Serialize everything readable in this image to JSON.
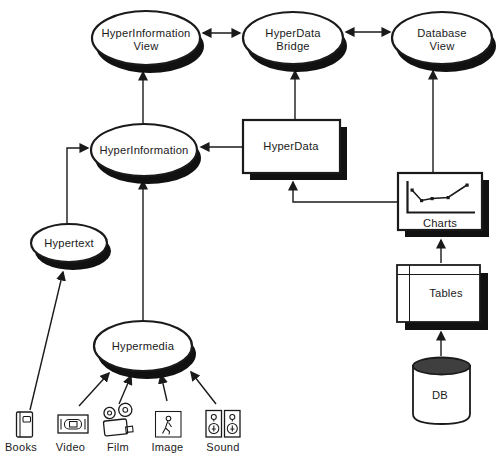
{
  "diagram": {
    "background": "#ffffff",
    "ink": "#1a1a1a",
    "shadow_color": "#111111",
    "db_top_color": "#3f3f3f",
    "nodes": {
      "hyperinformation_view": {
        "line1": "HyperInformation",
        "line2": "View",
        "shape": "ellipse"
      },
      "hyperdata_bridge": {
        "line1": "HyperData",
        "line2": "Bridge",
        "shape": "ellipse"
      },
      "database_view": {
        "line1": "Database",
        "line2": "View",
        "shape": "ellipse"
      },
      "hyperinformation": {
        "label": "HyperInformation",
        "shape": "ellipse"
      },
      "hyperdata": {
        "label": "HyperData",
        "shape": "rect"
      },
      "hypertext": {
        "label": "Hypertext",
        "shape": "ellipse"
      },
      "charts": {
        "label": "Charts",
        "shape": "rect-with-line-chart"
      },
      "tables": {
        "label": "Tables",
        "shape": "rect-with-grid"
      },
      "hypermedia": {
        "label": "Hypermedia",
        "shape": "ellipse"
      },
      "db": {
        "label": "DB",
        "shape": "cylinder"
      }
    },
    "media": [
      {
        "label": "Books",
        "icon": "book-icon"
      },
      {
        "label": "Video",
        "icon": "video-cassette-icon"
      },
      {
        "label": "Film",
        "icon": "film-camera-icon"
      },
      {
        "label": "Image",
        "icon": "image-figure-icon"
      },
      {
        "label": "Sound",
        "icon": "speakers-icon"
      }
    ],
    "edges": [
      {
        "from": "HyperInformation View",
        "to": "HyperData Bridge",
        "type": "bidirectional"
      },
      {
        "from": "HyperData Bridge",
        "to": "Database View",
        "type": "bidirectional"
      },
      {
        "from": "HyperInformation",
        "to": "HyperInformation View",
        "type": "arrow"
      },
      {
        "from": "HyperData",
        "to": "HyperData Bridge",
        "type": "arrow"
      },
      {
        "from": "Charts",
        "to": "Database View",
        "type": "arrow"
      },
      {
        "from": "HyperData",
        "to": "HyperInformation",
        "type": "arrow"
      },
      {
        "from": "Hypertext",
        "to": "HyperInformation",
        "type": "arrow"
      },
      {
        "from": "Hypermedia",
        "to": "HyperInformation",
        "type": "arrow"
      },
      {
        "from": "Charts",
        "to": "HyperData",
        "type": "arrow"
      },
      {
        "from": "Tables",
        "to": "Charts",
        "type": "arrow"
      },
      {
        "from": "DB",
        "to": "Tables",
        "type": "arrow"
      },
      {
        "from": "Books",
        "to": "Hypertext",
        "type": "arrow"
      },
      {
        "from": "Video",
        "to": "Hypermedia",
        "type": "arrow"
      },
      {
        "from": "Film",
        "to": "Hypermedia",
        "type": "arrow"
      },
      {
        "from": "Image",
        "to": "Hypermedia",
        "type": "arrow"
      },
      {
        "from": "Sound",
        "to": "Hypermedia",
        "type": "arrow"
      }
    ]
  }
}
